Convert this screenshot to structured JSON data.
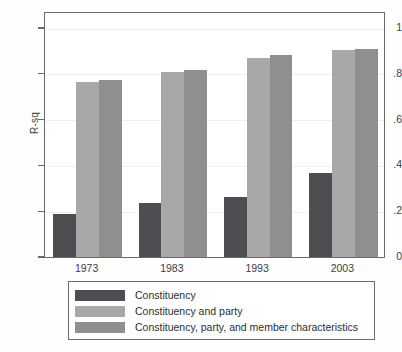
{
  "chart_data": {
    "type": "bar",
    "title": "",
    "subtitle": "",
    "xlabel": "",
    "ylabel": "R-sq",
    "categories": [
      "1973",
      "1983",
      "1993",
      "2003"
    ],
    "ylim": [
      0,
      1.06
    ],
    "yticks": [
      0,
      0.2,
      0.4,
      0.6,
      0.8,
      1
    ],
    "ytick_labels": [
      "0",
      ".2",
      ".4",
      ".6",
      ".8",
      "1"
    ],
    "grid": true,
    "legend_position": "bottom",
    "series": [
      {
        "name": "Constituency",
        "color": "#4d4d52",
        "values": [
          0.19,
          0.235,
          0.26,
          0.365
        ]
      },
      {
        "name": "Constituency and party",
        "color": "#a8a8a8",
        "values": [
          0.765,
          0.81,
          0.87,
          0.905
        ]
      },
      {
        "name": "Constituency, party, and member characteristics",
        "color": "#8f8f8f",
        "values": [
          0.775,
          0.815,
          0.88,
          0.91
        ]
      }
    ]
  },
  "axis": {
    "y_title": "R-sq"
  },
  "legend": {
    "items": [
      {
        "label": "Constituency"
      },
      {
        "label": "Constituency and party"
      },
      {
        "label": "Constituency, party, and member characteristics"
      }
    ]
  }
}
